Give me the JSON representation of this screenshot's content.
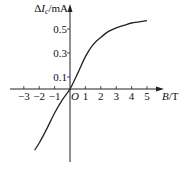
{
  "chart_data": {
    "type": "line",
    "title": "",
    "xlabel": "B/T",
    "ylabel": "ΔIc/mA",
    "origin_label": "O",
    "x_ticks": [
      -3,
      -2,
      -1,
      1,
      2,
      3,
      4,
      5
    ],
    "x_tick_labels": [
      "−3",
      "−2",
      "−1",
      "1",
      "2",
      "3",
      "4",
      "5"
    ],
    "y_ticks": [
      0.1,
      0.3,
      0.5
    ],
    "y_tick_labels": [
      "0.1",
      "0.3",
      "0.5"
    ],
    "xlim": [
      -3.5,
      6
    ],
    "ylim": [
      -0.6,
      0.7
    ],
    "grid": false,
    "legend": null,
    "series": [
      {
        "name": "ΔIc vs B",
        "x": [
          -2.3,
          -2.0,
          -1.5,
          -1.0,
          -0.5,
          0,
          0.5,
          1.0,
          1.5,
          2.0,
          2.5,
          3.0,
          3.5,
          4.0,
          4.5,
          5.0
        ],
        "y": [
          -0.51,
          -0.45,
          -0.33,
          -0.2,
          -0.09,
          0,
          0.13,
          0.27,
          0.37,
          0.43,
          0.48,
          0.51,
          0.53,
          0.55,
          0.56,
          0.57
        ]
      }
    ]
  }
}
